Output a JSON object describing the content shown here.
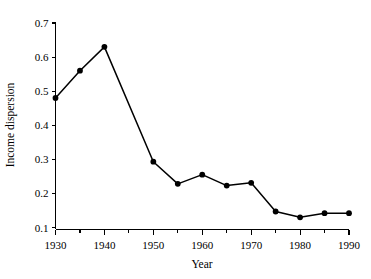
{
  "chart_data": {
    "type": "line",
    "title": "",
    "subtitle": "",
    "xlabel": "Year",
    "ylabel": "Income dispersion",
    "x": [
      1930,
      1935,
      1940,
      1945,
      1950,
      1955,
      1960,
      1965,
      1970,
      1975,
      1980,
      1985,
      1990
    ],
    "values": [
      0.48,
      0.56,
      0.63,
      null,
      0.293,
      0.228,
      0.255,
      0.223,
      0.231,
      0.147,
      0.13,
      0.142,
      0.142
    ],
    "series": [
      {
        "name": "Income dispersion",
        "x": [
          1930,
          1935,
          1940,
          1950,
          1955,
          1960,
          1965,
          1970,
          1975,
          1980,
          1985,
          1990
        ],
        "values": [
          0.48,
          0.56,
          0.63,
          0.293,
          0.228,
          0.255,
          0.223,
          0.231,
          0.147,
          0.13,
          0.142,
          0.142
        ]
      }
    ],
    "xlim": [
      1930,
      1990
    ],
    "ylim": [
      0.1,
      0.7
    ],
    "xticks": [
      1930,
      1940,
      1950,
      1960,
      1970,
      1980,
      1990
    ],
    "xtick_labels": [
      "1930",
      "1940",
      "1950",
      "1960",
      "1970",
      "1980",
      "1990"
    ],
    "xminor_ticks": [
      1935,
      1945,
      1955,
      1965,
      1975,
      1985
    ],
    "yticks": [
      0.1,
      0.2,
      0.3,
      0.4,
      0.5,
      0.6,
      0.7
    ],
    "ytick_labels": [
      "0.1",
      "0.2",
      "0.3",
      "0.4",
      "0.5",
      "0.6",
      "0.7"
    ],
    "grid": false,
    "legend": false,
    "legend_position": "none",
    "marker": "filled-circle",
    "line_color": "#000000",
    "marker_color": "#000000",
    "background_color": "#ffffff"
  },
  "axes": {
    "x_title": "Year",
    "y_title": "Income dispersion"
  }
}
